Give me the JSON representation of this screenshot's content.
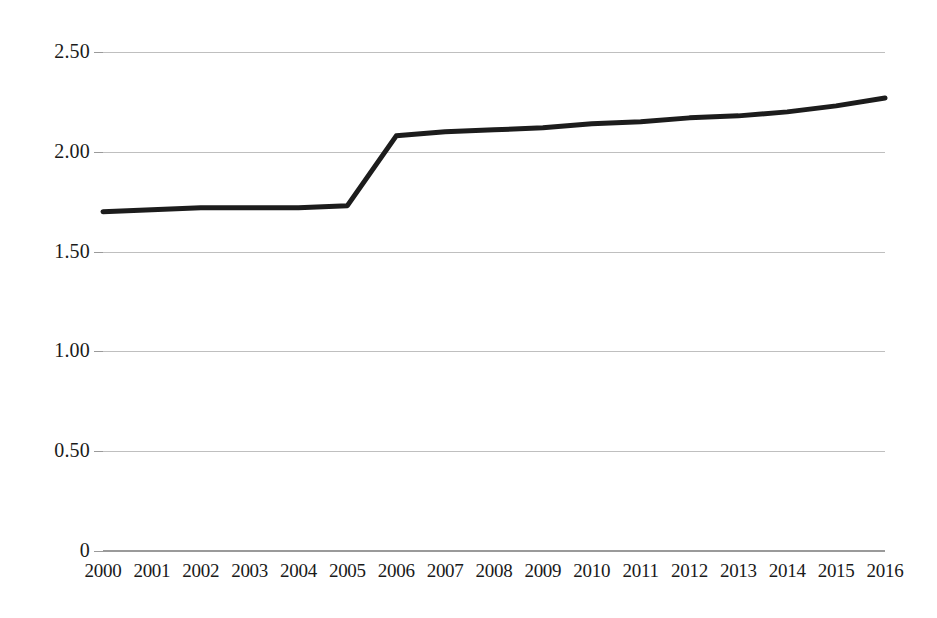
{
  "chart_data": {
    "type": "line",
    "title": "",
    "xlabel": "",
    "ylabel": "",
    "categories": [
      "2000",
      "2001",
      "2002",
      "2003",
      "2004",
      "2005",
      "2006",
      "2007",
      "2008",
      "2009",
      "2010",
      "2011",
      "2012",
      "2013",
      "2014",
      "2015",
      "2016"
    ],
    "values": [
      1.7,
      1.71,
      1.72,
      1.72,
      1.72,
      1.73,
      2.08,
      2.1,
      2.11,
      2.12,
      2.14,
      2.15,
      2.17,
      2.18,
      2.2,
      2.23,
      2.27
    ],
    "series": [
      {
        "name": "",
        "values": [
          1.7,
          1.71,
          1.72,
          1.72,
          1.72,
          1.73,
          2.08,
          2.1,
          2.11,
          2.12,
          2.14,
          2.15,
          2.17,
          2.18,
          2.2,
          2.23,
          2.27
        ]
      }
    ],
    "ylim": [
      0,
      2.5
    ],
    "ytick_labels": [
      "2.50",
      "2.00",
      "1.50",
      "1.00",
      "0.50",
      "0"
    ],
    "ytick_values": [
      2.5,
      2.0,
      1.5,
      1.0,
      0.5,
      0
    ],
    "grid": true,
    "grid_axis": "y",
    "legend": false,
    "legend_position": "none",
    "line_color": "#1c1c1c",
    "gridline_color": "#bfbfbf",
    "background_color": "#ffffff",
    "annotations": []
  },
  "axes": {
    "y_axis_name": "value-axis",
    "x_axis_name": "year-axis"
  }
}
